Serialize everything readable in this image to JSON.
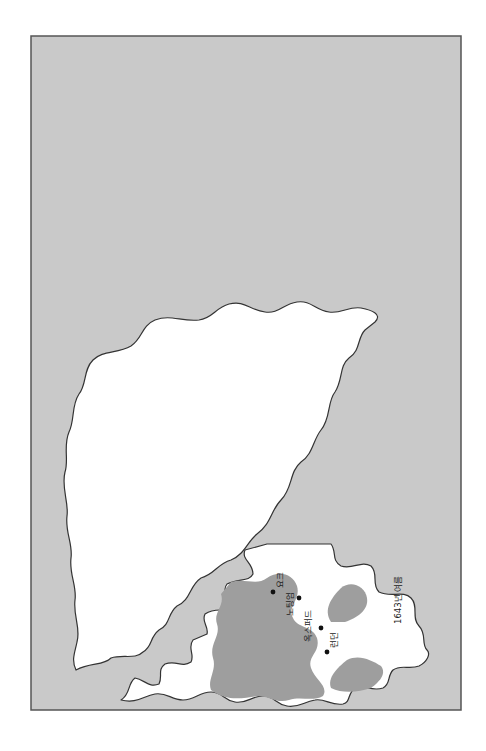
{
  "caption": "〈지도 17〉 내란(1643~1645)",
  "legend": {
    "swatch_color": "#9e9e9e",
    "label": "국왕군의 지배 지역"
  },
  "colors": {
    "sea": "#c9c9c9",
    "land": "#ffffff",
    "royalist": "#9e9e9e",
    "outline": "#333333"
  },
  "maps": [
    {
      "season": "1643년 여름",
      "cities": {
        "york": "요크",
        "nottingham": "노팅엄",
        "oxford": "옥스퍼드",
        "london": "런던"
      }
    },
    {
      "season": "1643~1644년 겨울",
      "cities": {
        "york": "요크",
        "nottingham": "노팅엄",
        "oxford": "옥스퍼드",
        "london": "런던"
      }
    },
    {
      "season": "1644~1645년 겨울",
      "cities": {
        "york": "요크",
        "nottingham": "노팅엄",
        "oxford": "옥스퍼드",
        "london": "런던"
      },
      "annotations": {
        "marston_moor": "마스턴 무어",
        "marston_moor_date": "1644년 여름",
        "lostwithiel": "로스트위시티엘",
        "lostwithiel_date": "1644년 여름"
      }
    },
    {
      "season": "1645년 여름",
      "cities": {
        "york": "요크",
        "nottingham": "노팅엄",
        "oxford": "옥스퍼드",
        "london": "런던"
      },
      "annotations": {
        "naseby": "네이즈비",
        "naseby_date": "1645년 여름"
      }
    }
  ]
}
